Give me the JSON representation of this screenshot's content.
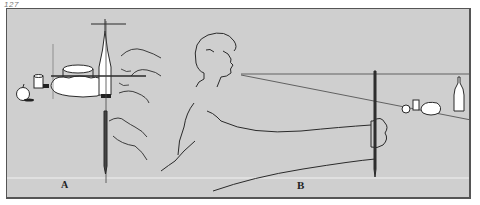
{
  "figure": {
    "number": "127",
    "panels": [
      {
        "id": "A",
        "label": "A"
      },
      {
        "id": "B",
        "label": "B"
      }
    ]
  },
  "colors": {
    "background": "#cfcfcf",
    "line": "#2a2a2a",
    "frame": "#555555"
  }
}
